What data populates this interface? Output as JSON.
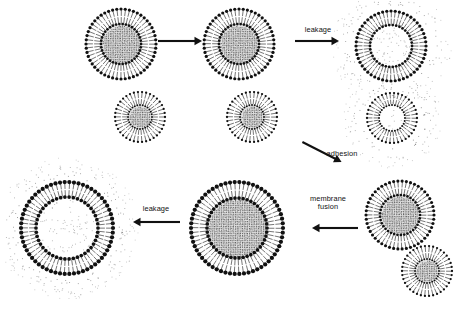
{
  "figure": {
    "background_color": "#ffffff",
    "ink_color": "#111111",
    "lumen_fill_color": "#c9c9c9",
    "width": 458,
    "height": 309
  },
  "labels": {
    "leakage_top": "leakage",
    "adhesion": "adhesion",
    "membrane_fusion_line1": "membrane",
    "membrane_fusion_line2": "fusion",
    "leakage_bottom": "leakage"
  },
  "arrows": [
    {
      "name": "arrow-top-left",
      "label": "",
      "direction": "right",
      "x": 158,
      "y": 41,
      "length": 44,
      "angle": 0
    },
    {
      "name": "arrow-top-right",
      "label": "leakage",
      "direction": "right",
      "x": 295,
      "y": 41,
      "length": 44,
      "angle": 0
    },
    {
      "name": "arrow-adhesion",
      "label": "adhesion",
      "direction": "down-right",
      "x": 300,
      "y": 152,
      "length": 44,
      "angle": 27
    },
    {
      "name": "arrow-membrane-fusion",
      "label": "membrane fusion",
      "direction": "left",
      "x": 312,
      "y": 228,
      "length": 46,
      "angle": 0
    },
    {
      "name": "arrow-bottom-leakage",
      "label": "leakage",
      "direction": "left",
      "x": 133,
      "y": 222,
      "length": 47,
      "angle": 0
    }
  ],
  "vesicles": [
    {
      "name": "vesicle-large-intact-1",
      "stage": "intact",
      "size": "large",
      "filled": true,
      "leaked_halo": false,
      "cx": 121,
      "cy": 44,
      "outer_radius": 35,
      "lumen_radius": 20,
      "heads": 52
    },
    {
      "name": "vesicle-small-intact-1",
      "stage": "intact",
      "size": "small",
      "filled": true,
      "leaked_halo": false,
      "cx": 140,
      "cy": 117,
      "outer_radius": 25,
      "lumen_radius": 12,
      "heads": 38
    },
    {
      "name": "vesicle-large-intact-2",
      "stage": "intact",
      "size": "large",
      "filled": true,
      "leaked_halo": false,
      "cx": 239,
      "cy": 44,
      "outer_radius": 35,
      "lumen_radius": 20,
      "heads": 52
    },
    {
      "name": "vesicle-small-intact-2",
      "stage": "intact",
      "size": "small",
      "filled": true,
      "leaked_halo": false,
      "cx": 252,
      "cy": 117,
      "outer_radius": 25,
      "lumen_radius": 12,
      "heads": 38
    },
    {
      "name": "vesicle-large-leaked",
      "stage": "leaked",
      "size": "large",
      "filled": false,
      "leaked_halo": true,
      "cx": 391,
      "cy": 46,
      "outer_radius": 35,
      "lumen_radius": 21,
      "heads": 52
    },
    {
      "name": "vesicle-small-leaked",
      "stage": "leaked",
      "size": "small",
      "filled": false,
      "leaked_halo": true,
      "cx": 392,
      "cy": 118,
      "outer_radius": 25,
      "lumen_radius": 13,
      "heads": 38
    },
    {
      "name": "vesicle-adhered-large",
      "stage": "adhered",
      "size": "large",
      "filled": true,
      "leaked_halo": false,
      "cx": 400,
      "cy": 215,
      "outer_radius": 34,
      "lumen_radius": 20,
      "heads": 50
    },
    {
      "name": "vesicle-adhered-small",
      "stage": "adhered",
      "size": "small",
      "filled": true,
      "leaked_halo": false,
      "cx": 427,
      "cy": 271,
      "outer_radius": 25,
      "lumen_radius": 12,
      "heads": 38
    },
    {
      "name": "vesicle-fused-large",
      "stage": "fused",
      "size": "xlarge",
      "filled": true,
      "leaked_halo": false,
      "cx": 237,
      "cy": 228,
      "outer_radius": 46,
      "lumen_radius": 30,
      "heads": 62
    },
    {
      "name": "vesicle-fused-leaked",
      "stage": "leaked",
      "size": "xlarge",
      "filled": false,
      "leaked_halo": true,
      "cx": 67,
      "cy": 228,
      "outer_radius": 46,
      "lumen_radius": 31,
      "heads": 62
    }
  ]
}
